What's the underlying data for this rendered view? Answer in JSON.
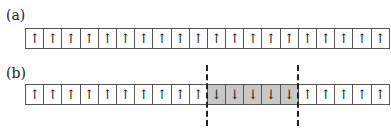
{
  "panels": [
    {
      "label": "(a)",
      "cells": [
        "↑",
        "↑",
        "↑",
        "↑",
        "↑",
        "↑",
        "↑",
        "↑",
        "↑",
        "↑",
        "↑",
        "↑",
        "↑",
        "↑",
        "↑",
        "↑",
        "↑",
        "↑",
        "↑",
        "↑"
      ]
    },
    {
      "label": "(b)",
      "cells": [
        "↑",
        "↑",
        "↑",
        "↑",
        "↑",
        "↑",
        "↑",
        "↑",
        "↑",
        "↑",
        "↓",
        "↓",
        "↓",
        "↓",
        "↓",
        "↑",
        "↑",
        "↑",
        "↑",
        "↑"
      ],
      "highlight_range": [
        10,
        14
      ],
      "highlight_color": "#c8c8c8"
    }
  ]
}
